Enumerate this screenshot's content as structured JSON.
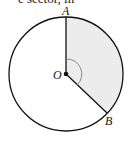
{
  "caption_fragment": "e sector, in",
  "diagram": {
    "type": "circle-sector",
    "center_label": "O",
    "points": [
      {
        "label": "A",
        "position": "top of circle"
      },
      {
        "label": "B",
        "position": "lower right of circle"
      }
    ],
    "shaded_region": "sector AOB",
    "angle_marker": "arc at O between OA and OB",
    "colors": {
      "stroke": "#111111",
      "shade": "#ececec",
      "angle_arc": "#888888"
    }
  }
}
